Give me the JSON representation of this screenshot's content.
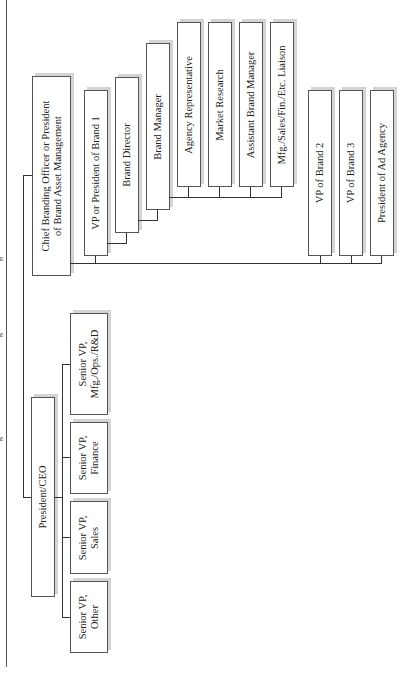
{
  "title_fragments": [
    "g",
    "g",
    "g"
  ],
  "chart": {
    "root": {
      "label": "President/CEO"
    },
    "senior_vps": [
      {
        "label": "Senior VP,\nMfg./Ops./R&D"
      },
      {
        "label": "Senior VP,\nFinance"
      },
      {
        "label": "Senior VP,\nSales"
      },
      {
        "label": "Senior VP,\nOther"
      }
    ],
    "cbo": {
      "label": "Chief Branding Officer or President\nof Brand Asset Management"
    },
    "brand1_chain": [
      {
        "label": "VP or President of Brand 1"
      },
      {
        "label": "Brand Director"
      },
      {
        "label": "Brand Manager"
      }
    ],
    "brand_manager_reports": [
      {
        "label": "Agency Representative"
      },
      {
        "label": "Market Research"
      },
      {
        "label": "Assistant Brand Manager"
      },
      {
        "label": "Mfg./Sales/Fin./Etc. Liaison"
      }
    ],
    "cbo_other_reports": [
      {
        "label": "VP of Brand 2"
      },
      {
        "label": "VP of Brand 3"
      },
      {
        "label": "President of Ad Agency"
      }
    ]
  }
}
